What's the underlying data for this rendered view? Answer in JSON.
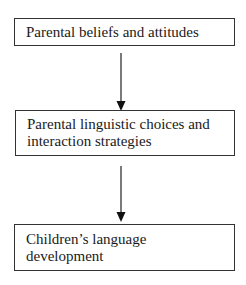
{
  "diagram": {
    "type": "flowchart",
    "direction": "top-to-bottom",
    "nodes": [
      {
        "id": "n1",
        "label": "Parental beliefs and attitudes"
      },
      {
        "id": "n2",
        "label": "Parental linguistic choices and interaction strategies"
      },
      {
        "id": "n3",
        "label": "Children’s language development"
      }
    ],
    "edges": [
      {
        "from": "n1",
        "to": "n2"
      },
      {
        "from": "n2",
        "to": "n3"
      }
    ]
  }
}
